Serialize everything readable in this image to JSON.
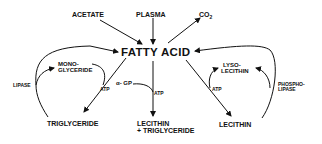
{
  "diagram": {
    "center": "FATTY ACID",
    "sources": {
      "acetate": "ACETATE",
      "plasma": "PLASMA",
      "co2": "CO",
      "co2_sub": "2"
    },
    "left": {
      "monoglyceride_line1": "MONO-",
      "monoglyceride_line2": "GLYCERIDE",
      "lipase": "LIPASE",
      "atp": "ATP",
      "triglyceride": "TRIGLYCERIDE"
    },
    "middle": {
      "alpha_gp": "α- GP",
      "atp": "ATP",
      "product_line1": "LECITHIN",
      "product_line2": "+ TRIGLYCERIDE"
    },
    "right": {
      "lysolecithin_line1": "LYSO-",
      "lysolecithin_line2": "LECITHIN",
      "phospholipase_line1": "PHOSPHO-",
      "phospholipase_line2": "LIPASE",
      "atp": "ATP",
      "lecithin": "LECITHIN"
    }
  }
}
